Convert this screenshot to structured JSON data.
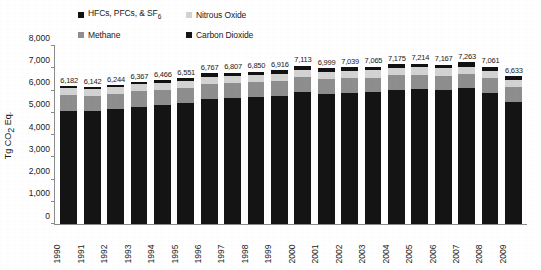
{
  "chart_data": {
    "type": "bar",
    "stacked": true,
    "title": "",
    "xlabel": "",
    "ylabel": "Tg CO2 Eq.",
    "ylabel_rich": "Tg CO₂ Eq.",
    "ylim": [
      0,
      8000
    ],
    "ytick_step": 1000,
    "ytick_labels": [
      "8,000",
      "7,000",
      "6,000",
      "5,000",
      "4,000",
      "3,000",
      "2,000",
      "1,000",
      "0"
    ],
    "ytick_values": [
      8000,
      7000,
      6000,
      5000,
      4000,
      3000,
      2000,
      1000,
      0
    ],
    "grid": false,
    "legend_position": "top",
    "categories": [
      "1990",
      "1991",
      "1992",
      "1993",
      "1994",
      "1995",
      "1996",
      "1997",
      "1998",
      "1999",
      "2000",
      "2001",
      "2002",
      "2003",
      "2004",
      "2005",
      "2006",
      "2007",
      "2008",
      "2009"
    ],
    "totals": [
      6182,
      6142,
      6244,
      6367,
      6466,
      6551,
      6767,
      6807,
      6850,
      6916,
      7113,
      6999,
      7039,
      7065,
      7175,
      7214,
      7167,
      7263,
      7061,
      6633
    ],
    "total_labels": [
      "6,182",
      "6,142",
      "6,244",
      "6,367",
      "6,466",
      "6,551",
      "6,767",
      "6,807",
      "6,850",
      "6,916",
      "7,113",
      "6,999",
      "7,039",
      "7,065",
      "7,175",
      "7,214",
      "7,167",
      "7,263",
      "7,061",
      "6,633"
    ],
    "series": [
      {
        "name": "Carbon Dioxide",
        "color": "#141414",
        "stack_order": 0,
        "values": [
          5100,
          5060,
          5150,
          5270,
          5350,
          5420,
          5620,
          5660,
          5690,
          5760,
          5940,
          5840,
          5880,
          5920,
          6020,
          6060,
          6020,
          6100,
          5900,
          5500
        ]
      },
      {
        "name": "Methane",
        "color": "#8e8e8e",
        "stack_order": 1,
        "values": [
          700,
          698,
          690,
          688,
          686,
          684,
          680,
          676,
          672,
          668,
          666,
          664,
          662,
          660,
          658,
          656,
          654,
          652,
          650,
          648
        ]
      },
      {
        "name": "Nitrous Oxide",
        "color": "#d3d3d3",
        "stack_order": 2,
        "values": [
          315,
          312,
          310,
          314,
          317,
          320,
          322,
          325,
          328,
          330,
          335,
          333,
          330,
          327,
          327,
          327,
          325,
          327,
          326,
          320
        ]
      },
      {
        "name": "HFCs, PFCs, & SF6",
        "name_rich": "HFCs, PFCs, & SF₆",
        "color": "#111111",
        "stack_order": 3,
        "values": [
          67,
          72,
          94,
          95,
          113,
          127,
          145,
          146,
          160,
          158,
          172,
          162,
          167,
          158,
          170,
          171,
          168,
          184,
          185,
          165
        ]
      }
    ]
  },
  "legend": {
    "items": [
      {
        "label": "HFCs, PFCs, & SF",
        "sub": "6",
        "color": "#111111",
        "marker": "square-marker-hfc"
      },
      {
        "label": "Nitrous Oxide",
        "sub": "",
        "color": "#d3d3d3",
        "marker": "square-marker-n2o"
      },
      {
        "label": "Methane",
        "sub": "",
        "color": "#8e8e8e",
        "marker": "square-marker-ch4"
      },
      {
        "label": "Carbon Dioxide",
        "sub": "",
        "color": "#141414",
        "marker": "square-marker-co2"
      }
    ]
  },
  "axis": {
    "y_title_main": "Tg CO",
    "y_title_sub": "2",
    "y_title_tail": " Eq."
  }
}
